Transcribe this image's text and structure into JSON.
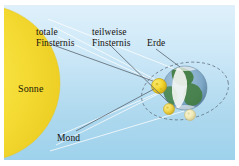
{
  "figure": {
    "background_top": "#dff0fb",
    "background_bottom": "#9ed2ec",
    "border_color": "#ffffff"
  },
  "labels": {
    "totale": {
      "line1": "totale",
      "line2": "Finsternis"
    },
    "teilweise": {
      "line1": "teilweise",
      "line2": "Finsternis"
    },
    "erde": {
      "text": "Erde"
    },
    "mond": {
      "text": "Mond"
    },
    "sonne": {
      "text": "Sonne"
    }
  },
  "bodies": {
    "sun": {
      "name": "Sonne",
      "color": "#f5dc35",
      "edge_color": "#e7c92b",
      "shape": "half-disc",
      "cx": -22,
      "cy": 78,
      "r": 78
    },
    "earth": {
      "name": "Erde",
      "ocean_color": "#7fa8c8",
      "land_color": "#3f7a3a",
      "cloud_color": "#f2f4f2",
      "cx": 181,
      "cy": 83,
      "r": 22
    },
    "moon_total": {
      "name": "Mond",
      "color": "#f2d32a",
      "edge_color": "#c9a818",
      "cx": 155,
      "cy": 81,
      "r": 7.5,
      "eclipse": "totale Finsternis"
    },
    "moon_partial": {
      "name": "Mond",
      "color": "#f0d54a",
      "edge_color": "#cbab22",
      "cx": 165,
      "cy": 104,
      "r": 5.5,
      "eclipse": "teilweise Finsternis"
    },
    "moon_far": {
      "name": "Mond",
      "color": "#efe9b6",
      "edge_color": "#cfc58d",
      "cx": 186,
      "cy": 110,
      "r": 5.5,
      "eclipse": "none"
    }
  },
  "orbit": {
    "name": "Mondbahn",
    "style": "dashed",
    "color": "#5b6a78",
    "cx": 181,
    "cy": 86,
    "rx": 44,
    "ry": 28,
    "rotation_deg": -12
  },
  "rays": {
    "color": "#ffffff",
    "count": 6,
    "description": "Lichtstrahlen von der Sonne zum Mond und zur Erde"
  },
  "shadow": {
    "umbra_color": "#8e8e84",
    "penumbra_color": "#b9b9ad",
    "description": "Kernschatten und Halbschatten des Mondes auf der Erde"
  },
  "leaders": {
    "color": "#5a6470",
    "items": [
      {
        "name": "leader-totale",
        "from_label": "totale Finsternis",
        "to_body": "moon_total"
      },
      {
        "name": "leader-teilweise",
        "from_label": "teilweise Finsternis",
        "to_body": "moon_partial"
      },
      {
        "name": "leader-erde",
        "from_label": "Erde",
        "to_body": "earth"
      },
      {
        "name": "leader-mond",
        "from_label": "Mond",
        "to_body": "moon_total"
      }
    ]
  }
}
